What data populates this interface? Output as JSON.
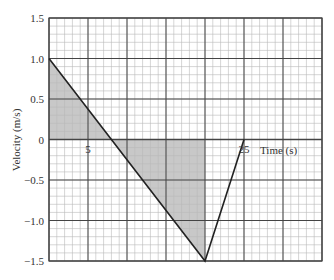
{
  "chart_data": {
    "type": "line",
    "title": "",
    "xlabel": "Time (s)",
    "ylabel": "Velocity (m/s)",
    "xlim": [
      0,
      35
    ],
    "ylim": [
      -1.5,
      1.5
    ],
    "grid": true,
    "x_major_step": 5,
    "x_minor_step": 1,
    "y_major_step": 0.5,
    "y_minor_step": 0.1,
    "x_tick_labels": [
      {
        "value": 5,
        "label": "5"
      },
      {
        "value": 25,
        "label": "25"
      }
    ],
    "y_tick_labels": [
      {
        "value": 1.5,
        "label": "1.5"
      },
      {
        "value": 1.0,
        "label": "1.0"
      },
      {
        "value": 0.5,
        "label": "0.5"
      },
      {
        "value": 0,
        "label": "0"
      },
      {
        "value": -0.5,
        "label": "−0.5"
      },
      {
        "value": -1.0,
        "label": "−1.0"
      },
      {
        "value": -1.5,
        "label": "−1.5"
      }
    ],
    "series": [
      {
        "name": "velocity",
        "x": [
          0,
          20,
          25
        ],
        "y": [
          1.0,
          -1.5,
          0
        ]
      }
    ],
    "shaded_regions": [
      {
        "name": "positive-area",
        "polygon": [
          [
            0,
            0
          ],
          [
            0,
            1.0
          ],
          [
            8,
            0
          ]
        ]
      },
      {
        "name": "negative-area",
        "polygon": [
          [
            8,
            0
          ],
          [
            20,
            -1.5
          ],
          [
            20,
            0
          ]
        ]
      }
    ],
    "colors": {
      "grid_minor": "#b8b8b8",
      "grid_major": "#444444",
      "line": "#222222",
      "shade": "#c8c8c8"
    }
  }
}
